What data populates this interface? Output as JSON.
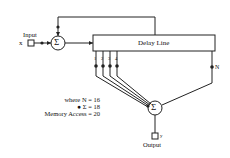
{
  "diagram": {
    "input_label": "Input",
    "input_symbol": "x",
    "output_label": "Output",
    "output_symbol": "y",
    "delay_line_label": "Delay Line",
    "sum_symbol": "Σ",
    "taps": [
      "1",
      "2",
      "3",
      "4"
    ],
    "last_tap": "N",
    "legend": {
      "line1": "where N = 16",
      "line2": "● Σ = 18",
      "line3": "Memory Access = 20"
    },
    "colors": {
      "stroke": "#222222",
      "background": "#ffffff"
    }
  }
}
